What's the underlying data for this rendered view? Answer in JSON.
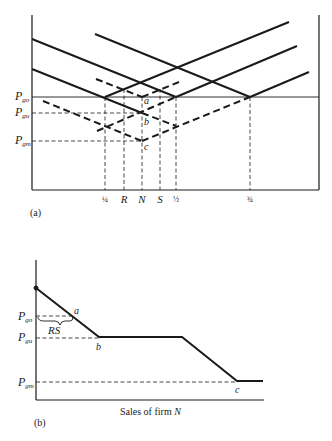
{
  "panel_a": {
    "label": "(a)",
    "price_levels": [
      {
        "name": "P_go",
        "main": "P",
        "sub": "go",
        "y": 97
      },
      {
        "name": "P_gu",
        "main": "P",
        "sub": "gu",
        "y": 113
      },
      {
        "name": "P_gm",
        "main": "P",
        "sub": "gm",
        "y": 141
      }
    ],
    "x_ticks": [
      {
        "label": "¼",
        "x": 105
      },
      {
        "label": "R",
        "x": 124
      },
      {
        "label": "N",
        "x": 142
      },
      {
        "label": "S",
        "x": 160
      },
      {
        "label": "½",
        "x": 176
      },
      {
        "label": "¾",
        "x": 250
      }
    ],
    "points": [
      {
        "label": "a",
        "x": 142,
        "y": 97
      },
      {
        "label": "b",
        "x": 142,
        "y": 113
      },
      {
        "label": "c",
        "x": 142,
        "y": 141
      }
    ]
  },
  "panel_b": {
    "label": "(b)",
    "xlabel_prefix": "Sales of firm ",
    "xlabel_var": "N",
    "price_levels": [
      {
        "name": "P_go",
        "main": "P",
        "sub": "go",
        "y": 316
      },
      {
        "name": "P_gu",
        "main": "P",
        "sub": "gu",
        "y": 338
      },
      {
        "name": "P_gm",
        "main": "P",
        "sub": "gm",
        "y": 383
      }
    ],
    "brace_label": "RS",
    "points": [
      {
        "label": "a",
        "x": 76,
        "y": 311
      },
      {
        "label": "b",
        "x": 98,
        "y": 349
      },
      {
        "label": "c",
        "x": 237,
        "y": 393
      }
    ]
  }
}
